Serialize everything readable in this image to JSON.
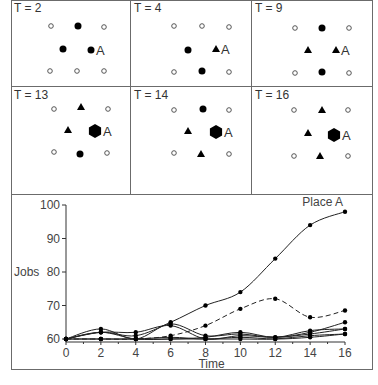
{
  "panels": [
    {
      "label": "T = 2",
      "nodes": [
        {
          "type": "open",
          "x": 40,
          "y": 26
        },
        {
          "type": "dot",
          "x": 67,
          "y": 26
        },
        {
          "type": "open",
          "x": 93,
          "y": 27
        },
        {
          "type": "dot",
          "x": 52,
          "y": 49
        },
        {
          "type": "dot",
          "x": 80,
          "y": 50,
          "label": "A"
        },
        {
          "type": "open",
          "x": 39,
          "y": 71
        },
        {
          "type": "open",
          "x": 66,
          "y": 71
        },
        {
          "type": "open",
          "x": 93,
          "y": 71
        }
      ]
    },
    {
      "label": "T = 4",
      "nodes": [
        {
          "type": "open",
          "x": 43,
          "y": 26
        },
        {
          "type": "open",
          "x": 71,
          "y": 26
        },
        {
          "type": "open",
          "x": 98,
          "y": 27
        },
        {
          "type": "dot",
          "x": 57,
          "y": 50
        },
        {
          "type": "tri",
          "x": 85,
          "y": 49,
          "label": "A"
        },
        {
          "type": "open",
          "x": 43,
          "y": 72
        },
        {
          "type": "dot",
          "x": 71,
          "y": 71
        },
        {
          "type": "open",
          "x": 98,
          "y": 72
        }
      ]
    },
    {
      "label": "T = 9",
      "nodes": [
        {
          "type": "open",
          "x": 43,
          "y": 28
        },
        {
          "type": "dot",
          "x": 70,
          "y": 28
        },
        {
          "type": "open",
          "x": 97,
          "y": 28
        },
        {
          "type": "tri",
          "x": 56,
          "y": 50
        },
        {
          "type": "tri",
          "x": 84,
          "y": 50,
          "label": "A"
        },
        {
          "type": "open",
          "x": 43,
          "y": 73
        },
        {
          "type": "dot",
          "x": 70,
          "y": 72
        },
        {
          "type": "open",
          "x": 97,
          "y": 73
        }
      ]
    },
    {
      "label": "T = 13",
      "nodes": [
        {
          "type": "open",
          "x": 43,
          "y": 22
        },
        {
          "type": "tri",
          "x": 70,
          "y": 20
        },
        {
          "type": "open",
          "x": 97,
          "y": 22
        },
        {
          "type": "tri",
          "x": 57,
          "y": 43
        },
        {
          "type": "hex",
          "x": 84,
          "y": 44,
          "label": "A"
        },
        {
          "type": "open",
          "x": 43,
          "y": 65
        },
        {
          "type": "dot",
          "x": 69,
          "y": 67
        },
        {
          "type": "open",
          "x": 96,
          "y": 66
        }
      ]
    },
    {
      "label": "T = 14",
      "nodes": [
        {
          "type": "open",
          "x": 43,
          "y": 23
        },
        {
          "type": "dot",
          "x": 72,
          "y": 22
        },
        {
          "type": "open",
          "x": 98,
          "y": 23
        },
        {
          "type": "tri",
          "x": 57,
          "y": 44
        },
        {
          "type": "hex",
          "x": 85,
          "y": 45,
          "label": "A"
        },
        {
          "type": "open",
          "x": 43,
          "y": 66
        },
        {
          "type": "tri",
          "x": 70,
          "y": 67
        },
        {
          "type": "open",
          "x": 98,
          "y": 67
        }
      ]
    },
    {
      "label": "T = 16",
      "nodes": [
        {
          "type": "open",
          "x": 42,
          "y": 23
        },
        {
          "type": "tri",
          "x": 70,
          "y": 23
        },
        {
          "type": "open",
          "x": 96,
          "y": 23
        },
        {
          "type": "tri",
          "x": 56,
          "y": 46
        },
        {
          "type": "hex",
          "x": 82,
          "y": 48,
          "label": "A"
        },
        {
          "type": "open",
          "x": 42,
          "y": 69
        },
        {
          "type": "tri",
          "x": 68,
          "y": 69
        },
        {
          "type": "open",
          "x": 96,
          "y": 69
        }
      ]
    }
  ],
  "chart_data": {
    "type": "line",
    "title": "",
    "xlabel": "Time",
    "ylabel": "Jobs",
    "x": [
      0,
      2,
      4,
      6,
      8,
      10,
      12,
      14,
      16
    ],
    "xticks": [
      0,
      2,
      4,
      6,
      8,
      10,
      12,
      14,
      16
    ],
    "yticks": [
      60,
      70,
      80,
      90,
      100
    ],
    "xlim": [
      0,
      16
    ],
    "ylim": [
      60,
      100
    ],
    "grid": false,
    "annotations": [
      {
        "text": "Place A",
        "x": 14.5,
        "y": 99
      }
    ],
    "series": [
      {
        "name": "Place A",
        "style": "solid",
        "values": [
          60,
          62,
          61,
          65,
          70,
          74,
          84,
          94,
          98
        ]
      },
      {
        "name": "Place (dashed)",
        "style": "dashed",
        "values": [
          60,
          60,
          60,
          61,
          64,
          69,
          72,
          66.5,
          68.5
        ]
      },
      {
        "name": "Place 3",
        "style": "solid",
        "values": [
          60,
          63,
          60,
          64.5,
          61,
          61.5,
          60.5,
          62,
          65
        ]
      },
      {
        "name": "Place 4",
        "style": "solid",
        "values": [
          60,
          62,
          62,
          64,
          60,
          61,
          60.5,
          61.5,
          63
        ]
      },
      {
        "name": "Place 5",
        "style": "solid",
        "values": [
          60,
          62,
          60,
          60,
          60.5,
          62,
          60.5,
          62.5,
          63
        ]
      },
      {
        "name": "Place 6",
        "style": "solid",
        "values": [
          60,
          60,
          60,
          60,
          60,
          60,
          60,
          61,
          61.5
        ]
      },
      {
        "name": "Place 7",
        "style": "solid",
        "values": [
          60,
          60,
          60,
          60.5,
          60,
          60.5,
          60,
          60.5,
          61.5
        ]
      }
    ]
  }
}
